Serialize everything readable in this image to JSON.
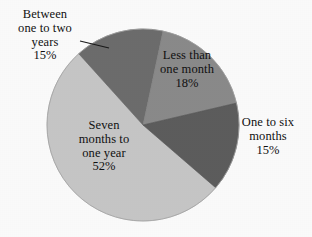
{
  "chart_data": {
    "type": "pie",
    "title": "",
    "subtitle": "",
    "xlabel": "",
    "ylabel": "",
    "legend_position": "none",
    "grid": false,
    "labels_position": "on-slices-and-callout",
    "start_angle_deg": 12,
    "direction": "clockwise",
    "categories": [
      "Less than one month",
      "One to six months",
      "Seven months to one year",
      "Between one to two years"
    ],
    "values": [
      18,
      15,
      52,
      15
    ],
    "value_unit": "%",
    "colors": [
      "#8c8c8c",
      "#5e5e5e",
      "#c9c9c9",
      "#6e6e6e"
    ],
    "slices": [
      {
        "name": "Less than one month",
        "label_line1": "Less than",
        "label_line2": "one month",
        "value": 18,
        "value_text": "18%",
        "color": "#8c8c8c",
        "label_placement": "inside"
      },
      {
        "name": "One to six months",
        "label_line1": "One to six",
        "label_line2": "months",
        "value": 15,
        "value_text": "15%",
        "color": "#5e5e5e",
        "label_placement": "outside-right"
      },
      {
        "name": "Seven months to one year",
        "label_line1": "Seven",
        "label_line2": "months to",
        "label_line3": "one year",
        "value": 52,
        "value_text": "52%",
        "color": "#c9c9c9",
        "label_placement": "inside"
      },
      {
        "name": "Between one to two years",
        "label_line1": "Between",
        "label_line2": "one to two",
        "label_line3": "years",
        "value": 15,
        "value_text": "15%",
        "color": "#6e6e6e",
        "label_placement": "outside-left-callout"
      }
    ]
  },
  "labels": {
    "between_one_to_two_years": "Between\none to two\nyears\n15%",
    "less_than_one_month": "Less than\none month\n18%",
    "one_to_six_months": "One to six\nmonths\n15%",
    "seven_months_to_one_year": "Seven\nmonths to\none year\n52%"
  },
  "style": {
    "background": "#ffffff",
    "text_color": "#111111",
    "outline_color": "#9a9a9a",
    "leader_line_color": "#1a1a1a"
  }
}
